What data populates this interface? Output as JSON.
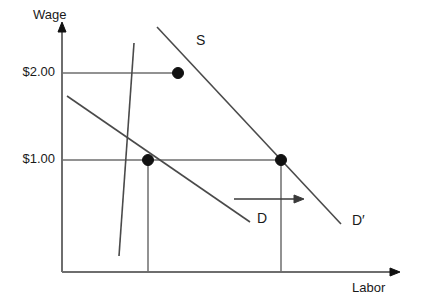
{
  "figure": {
    "kind": "supply-demand-diagram",
    "background_color": "#ffffff",
    "axis_color": "#6e6e6e",
    "curve_color": "#4a4a4a",
    "dot_color": "#111111"
  },
  "axes": {
    "y_title": "Wage",
    "x_title": "Labor",
    "origin": {
      "x": 62,
      "y": 272
    },
    "y_top": {
      "x": 62,
      "y": 24
    },
    "x_right": {
      "x": 400,
      "y": 272
    },
    "y_tick_labels": [
      "$2.00",
      "$1.00"
    ],
    "y_tick_values": [
      2.0,
      1.0
    ],
    "y_tick_pixels": [
      73,
      160
    ]
  },
  "curves": [
    {
      "id": "supply",
      "label": "S",
      "label_pos": {
        "x": 196,
        "y": 33
      },
      "x1": 134,
      "y1": 43,
      "x2": 119,
      "y2": 256
    },
    {
      "id": "demand-original",
      "label": "D",
      "label_pos": {
        "x": 257,
        "y": 211
      },
      "x1": 67,
      "y1": 96,
      "x2": 250,
      "y2": 222
    },
    {
      "id": "demand-shifted",
      "label": "D′",
      "label_pos": {
        "x": 352,
        "y": 213
      },
      "x1": 157,
      "y1": 27,
      "x2": 341,
      "y2": 224
    }
  ],
  "equilibria": [
    {
      "name": "new-equilibrium-high-wage",
      "wage_label": "$2.00",
      "wage_value": 2.0,
      "x": 178,
      "y": 73,
      "has_guide_line": true,
      "has_drop_line": false
    },
    {
      "name": "original-equilibrium",
      "wage_label": "$1.00",
      "wage_value": 1.0,
      "x": 148,
      "y": 160,
      "has_guide_line": true,
      "has_drop_line": true
    },
    {
      "name": "quantity-demanded-at-one-dollar",
      "wage_label": "$1.00",
      "wage_value": 1.0,
      "x": 281,
      "y": 160,
      "has_guide_line": true,
      "has_drop_line": true
    }
  ],
  "annotations": [
    {
      "name": "demand-shift-arrow",
      "meaning": "rightward shift of labor demand",
      "x1": 234,
      "y1": 199,
      "x2": 303,
      "y2": 199,
      "direction": "right"
    }
  ]
}
